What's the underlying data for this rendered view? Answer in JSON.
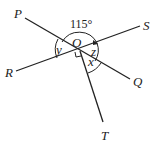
{
  "diagram": {
    "points": {
      "P": "P",
      "Q": "Q",
      "R": "R",
      "S": "S",
      "T": "T",
      "O": "O"
    },
    "angles": {
      "given": "115°",
      "x": "x",
      "y": "y",
      "z": "z"
    },
    "lines": [
      "PQ",
      "RS",
      "OT"
    ],
    "right_angle": "∠ROT = 90°"
  }
}
